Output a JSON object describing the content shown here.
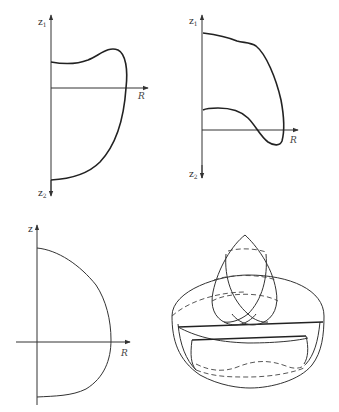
{
  "figures": [
    {
      "id": "panel-top-left",
      "axis_labels": {
        "top": "z",
        "top_sub": "1",
        "bottom": "z",
        "bottom_sub": "2",
        "right": "R"
      }
    },
    {
      "id": "panel-top-right",
      "axis_labels": {
        "top": "z",
        "top_sub": "1",
        "bottom": "z",
        "bottom_sub": "2",
        "right": "R"
      }
    },
    {
      "id": "panel-bottom-left",
      "axis_labels": {
        "top": "z",
        "right": "R"
      }
    },
    {
      "id": "panel-bottom-right",
      "description": "3D solid of revolution: lens-shaped intersecting surfaces atop a bowl-shaped body"
    }
  ],
  "colors": {
    "line": "#222222",
    "background": "#ffffff"
  }
}
